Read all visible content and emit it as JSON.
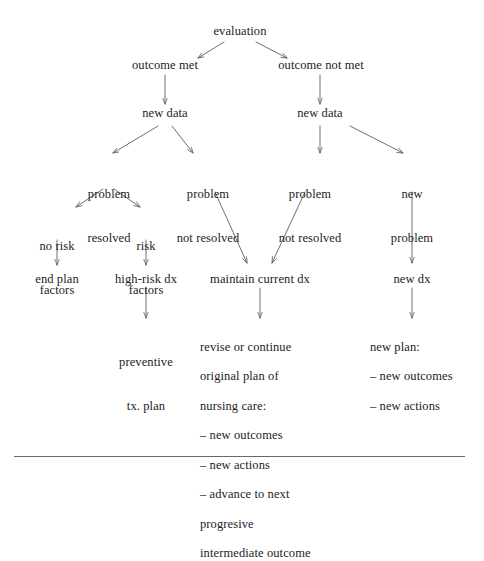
{
  "diagram": {
    "title": "evaluation",
    "style": {
      "background": "#ffffff",
      "text_color": "#1c1c1c",
      "line_color": "#555555",
      "rule_color": "#6a6a6a"
    },
    "nodes": {
      "evaluation": "evaluation",
      "outcome_met": "outcome met",
      "outcome_not_met": "outcome not met",
      "new_data_left": "new data",
      "new_data_right": "new data",
      "problem_resolved": "problem\nresolved",
      "problem_not_resolved_a": "problem\nnot resolved",
      "problem_not_resolved_b": "problem\nnot resolved",
      "new_problem": "new\nproblem",
      "no_risk_factors": "no risk\nfactors",
      "risk_factors": "risk\nfactors",
      "end_plan": "end plan",
      "high_risk_dx": "high-risk dx",
      "maintain_current_dx": "maintain current dx",
      "new_dx": "new dx",
      "preventive_tx_plan": "preventive\ntx. plan",
      "revise_plan_block": "revise or continue\noriginal plan of\nnursing care:\n– new outcomes\n– new actions\n– advance to next\n   progresive\n   intermediate outcome",
      "new_plan_block": "new plan:\n– new outcomes\n– new actions"
    },
    "node_lines": {
      "problem_resolved": [
        "problem",
        "resolved"
      ],
      "problem_not_resolved_a": [
        "problem",
        "not resolved"
      ],
      "problem_not_resolved_b": [
        "problem",
        "not resolved"
      ],
      "new_problem": [
        "new",
        "problem"
      ],
      "no_risk_factors": [
        "no risk",
        "factors"
      ],
      "risk_factors": [
        "risk",
        "factors"
      ],
      "preventive_tx_plan": [
        "preventive",
        "tx. plan"
      ],
      "revise_plan_block": [
        "revise or continue",
        "original plan of",
        "nursing care:",
        "– new outcomes",
        "– new actions",
        "– advance to next",
        "   progresive",
        "   intermediate outcome"
      ],
      "new_plan_block": [
        "new plan:",
        "– new outcomes",
        "– new actions"
      ]
    },
    "edges": [
      {
        "from": "evaluation",
        "to": "outcome_met",
        "kind": "diagonal-left"
      },
      {
        "from": "evaluation",
        "to": "outcome_not_met",
        "kind": "diagonal-right"
      },
      {
        "from": "outcome_met",
        "to": "new_data_left",
        "kind": "vertical"
      },
      {
        "from": "outcome_not_met",
        "to": "new_data_right",
        "kind": "vertical"
      },
      {
        "from": "new_data_left",
        "to": "problem_resolved",
        "kind": "diagonal-left"
      },
      {
        "from": "new_data_left",
        "to": "problem_not_resolved_a",
        "kind": "diagonal-right"
      },
      {
        "from": "new_data_right",
        "to": "problem_not_resolved_b",
        "kind": "vertical"
      },
      {
        "from": "new_data_right",
        "to": "new_problem",
        "kind": "diagonal-right"
      },
      {
        "from": "problem_resolved",
        "to": "no_risk_factors",
        "kind": "diagonal-left"
      },
      {
        "from": "problem_resolved",
        "to": "risk_factors",
        "kind": "diagonal-right"
      },
      {
        "from": "no_risk_factors",
        "to": "end_plan",
        "kind": "vertical"
      },
      {
        "from": "risk_factors",
        "to": "high_risk_dx",
        "kind": "vertical"
      },
      {
        "from": "problem_not_resolved_a",
        "to": "maintain_current_dx",
        "kind": "diagonal-right"
      },
      {
        "from": "problem_not_resolved_b",
        "to": "maintain_current_dx",
        "kind": "diagonal-left"
      },
      {
        "from": "new_problem",
        "to": "new_dx",
        "kind": "vertical"
      },
      {
        "from": "high_risk_dx",
        "to": "preventive_tx_plan",
        "kind": "vertical"
      },
      {
        "from": "maintain_current_dx",
        "to": "revise_plan_block",
        "kind": "vertical"
      },
      {
        "from": "new_dx",
        "to": "new_plan_block",
        "kind": "vertical"
      }
    ]
  }
}
